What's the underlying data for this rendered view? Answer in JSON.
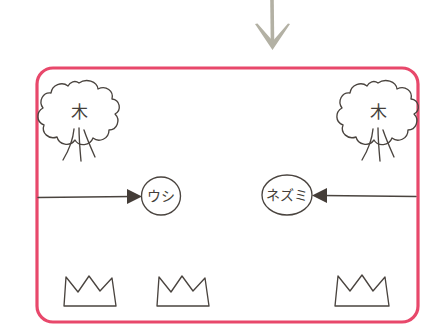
{
  "diagram": {
    "type": "hand-drawn-scene",
    "background_color": "#ffffff",
    "ink_color": "#4a443f",
    "enclosure": {
      "name": "fenced-area",
      "border_color": "#e8486b",
      "border_width": 3.2,
      "corner_radius": 16,
      "x": 37,
      "y": 68,
      "width": 381,
      "height": 254
    },
    "top_arrow": {
      "name": "downward-arrow",
      "color": "#b3b1a4",
      "direction": "down",
      "from": {
        "x": 272,
        "y": 0
      },
      "to": {
        "x": 272,
        "y": 50
      }
    },
    "trees": [
      {
        "name": "tree-left",
        "label": "木",
        "cx": 79,
        "cy": 113,
        "canopy_radius": 30
      },
      {
        "name": "tree-right",
        "label": "木",
        "cx": 378,
        "cy": 113,
        "canopy_radius": 30
      }
    ],
    "animals": [
      {
        "name": "animal-cow",
        "label": "ウシ",
        "shape": "circle",
        "cx": 161,
        "cy": 196,
        "rx": 19,
        "ry": 19
      },
      {
        "name": "animal-mouse",
        "label": "ネズミ",
        "shape": "ellipse",
        "cx": 287,
        "cy": 195,
        "rx": 25,
        "ry": 20
      }
    ],
    "flow_arrows": [
      {
        "name": "arrow-into-cow",
        "direction": "right",
        "color": "#4a443f",
        "from": {
          "x": 38,
          "y": 197
        },
        "to": {
          "x": 140,
          "y": 197
        }
      },
      {
        "name": "arrow-into-mouse",
        "direction": "left",
        "color": "#4a443f",
        "from": {
          "x": 416,
          "y": 196
        },
        "to": {
          "x": 314,
          "y": 196
        }
      }
    ],
    "bushes": [
      {
        "name": "bush-1",
        "x": 62,
        "y": 275,
        "width": 54,
        "height": 32
      },
      {
        "name": "bush-2",
        "x": 155,
        "y": 275,
        "width": 54,
        "height": 32
      },
      {
        "name": "bush-3",
        "x": 333,
        "y": 274,
        "width": 56,
        "height": 33
      }
    ]
  }
}
